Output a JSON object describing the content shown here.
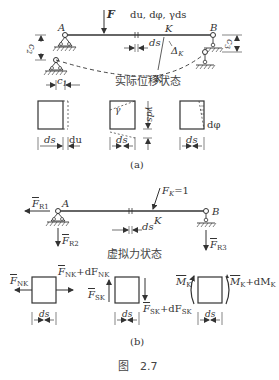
{
  "figure": {
    "caption": "图　2.7",
    "part_a_label": "(a)",
    "part_b_label": "(b)"
  },
  "part_a": {
    "title": "实际位移状态",
    "load_label": "F",
    "deformation_label": "du, dφ, γds",
    "support_a": "A",
    "support_b": "B",
    "point_k": "K",
    "point_k_prime": "K′",
    "displacement": "Δ",
    "displacement_sub": "K",
    "ds_label": "ds",
    "c1": "c",
    "c1_sub": "1",
    "c2": "c",
    "c2_sub": "2",
    "c3": "c",
    "c3_sub": "3",
    "elements": [
      {
        "name": "axial",
        "width_label": "ds",
        "extra_label": "du"
      },
      {
        "name": "shear",
        "width_label": "ds",
        "angle": "γ",
        "shift": "γds"
      },
      {
        "name": "bending",
        "width_label": "ds",
        "rotation": "dφ"
      }
    ]
  },
  "part_b": {
    "title": "虚拟力状态",
    "unit_load": "F",
    "unit_load_sub": "K",
    "unit_load_value": "=1",
    "support_a": "A",
    "support_b": "B",
    "point_k": "K",
    "ds_label": "ds",
    "reactions": [
      {
        "sym": "F",
        "sub": "R1"
      },
      {
        "sym": "F",
        "sub": "R2"
      },
      {
        "sym": "F",
        "sub": "R3"
      }
    ],
    "elements": [
      {
        "name": "axial",
        "left": "F",
        "left_sub": "NK",
        "right": "F",
        "right_sub": "NK",
        "right_d": "+dF",
        "right_d_sub": "NK",
        "width_label": "ds"
      },
      {
        "name": "shear",
        "left": "F",
        "left_sub": "SK",
        "right": "F",
        "right_sub": "SK",
        "right_d": "+dF",
        "right_d_sub": "SK",
        "width_label": "ds"
      },
      {
        "name": "moment",
        "left": "M",
        "left_sub": "K",
        "right": "M",
        "right_sub": "K",
        "right_d": "+dM",
        "right_d_sub": "K",
        "width_label": "ds"
      }
    ]
  }
}
